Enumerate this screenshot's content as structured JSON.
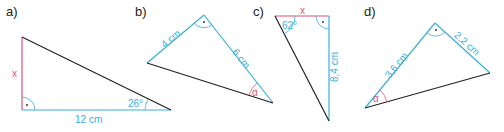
{
  "colors": {
    "given": "#3ab0dc",
    "unknown": "#e0507a",
    "hypotenuse": "#222222"
  },
  "figures": [
    {
      "label": "a)",
      "sides": [
        {
          "text": "x",
          "role": "unknown"
        },
        {
          "text": "12 cm",
          "role": "given"
        }
      ],
      "angles": [
        {
          "text": "26°",
          "role": "given"
        },
        {
          "text": "·",
          "role": "right-angle"
        }
      ]
    },
    {
      "label": "b)",
      "sides": [
        {
          "text": "4 cm",
          "role": "given"
        },
        {
          "text": "6 cm",
          "role": "given"
        }
      ],
      "angles": [
        {
          "text": "α",
          "role": "unknown"
        },
        {
          "text": "·",
          "role": "right-angle"
        }
      ]
    },
    {
      "label": "c)",
      "sides": [
        {
          "text": "x",
          "role": "unknown"
        },
        {
          "text": "8,4 cm",
          "role": "given"
        }
      ],
      "angles": [
        {
          "text": "62°",
          "role": "given"
        },
        {
          "text": "·",
          "role": "right-angle"
        }
      ]
    },
    {
      "label": "d)",
      "sides": [
        {
          "text": "3,6 cm",
          "role": "given"
        },
        {
          "text": "2,2 cm",
          "role": "given"
        }
      ],
      "angles": [
        {
          "text": "α",
          "role": "unknown"
        },
        {
          "text": "·",
          "role": "right-angle"
        }
      ]
    }
  ]
}
